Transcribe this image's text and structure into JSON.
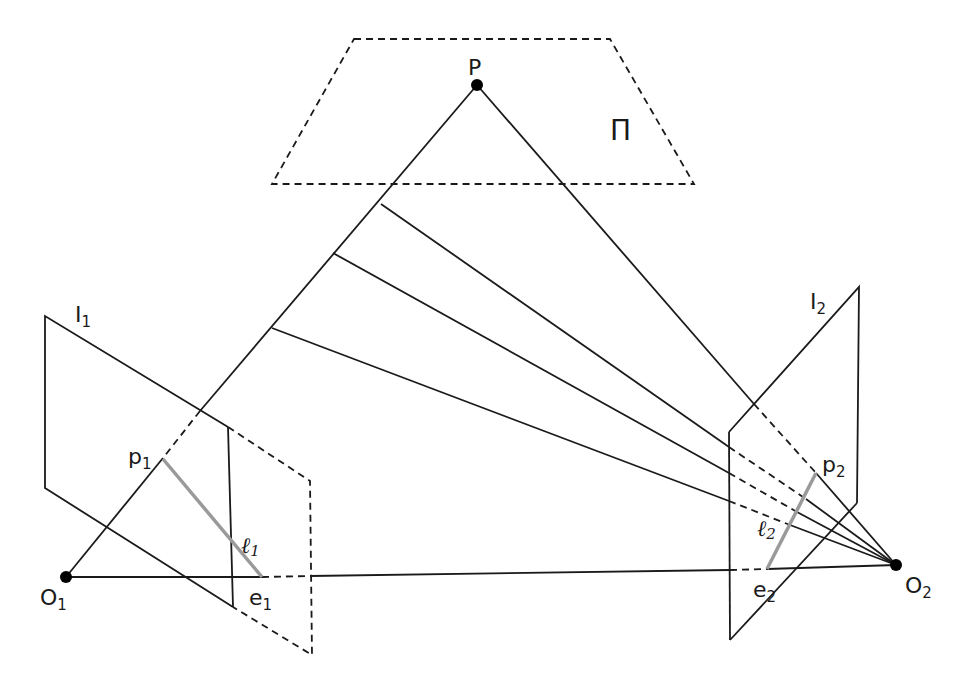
{
  "diagram": {
    "labels": {
      "point": "P",
      "plane": "Π",
      "image1": {
        "main": "I",
        "sub": "1"
      },
      "image2": {
        "main": "I",
        "sub": "2"
      },
      "p1": {
        "main": "p",
        "sub": "1"
      },
      "p2": {
        "main": "p",
        "sub": "2"
      },
      "e1": {
        "main": "e",
        "sub": "1"
      },
      "e2": {
        "main": "e",
        "sub": "2"
      },
      "O1": {
        "main": "O",
        "sub": "1"
      },
      "O2": {
        "main": "O",
        "sub": "2"
      },
      "l1": {
        "main": "ℓ",
        "sub": "1"
      },
      "l2": {
        "main": "ℓ",
        "sub": "2"
      }
    },
    "colors": {
      "line": "#1a1a1a",
      "epipolar_line": "#9a9a9a",
      "background": "#ffffff"
    }
  }
}
